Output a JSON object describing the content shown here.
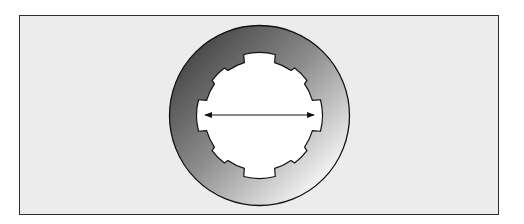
{
  "diagram": {
    "type": "splined-ring-cross-section",
    "frame": {
      "x": 19,
      "y": 15,
      "width": 480,
      "height": 200,
      "background": "#ececec",
      "border": "#2e2e2e"
    },
    "ring": {
      "center": [
        259.5,
        115.5
      ],
      "outer_radius": 90,
      "gradient_dark": "#4c4c4c",
      "gradient_mid": "#8a8a8a",
      "gradient_light": "#f2f2f2",
      "stroke": "#111111"
    },
    "bore": {
      "fill": "#ffffff",
      "base_radius": 55,
      "major_notches": {
        "count": 4,
        "start_angle_deg": 0,
        "radius": 63,
        "half_angle_deg": 16
      },
      "minor_notches": {
        "count": 4,
        "start_angle_deg": 45,
        "radius": 59,
        "half_angle_deg": 10
      }
    },
    "dimension_arrow": {
      "label": "",
      "x1": 205,
      "x2": 314,
      "y": 115,
      "color": "#111111",
      "double_headed": true
    }
  }
}
